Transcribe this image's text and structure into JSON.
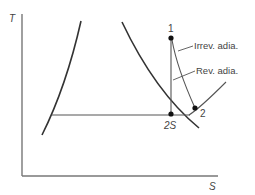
{
  "diagram": {
    "type": "T-S diagram",
    "axes": {
      "y_label": "T",
      "x_label": "S"
    },
    "points": {
      "p1": "1",
      "p2": "2",
      "p2s": "2S"
    },
    "annotations": {
      "irreversible": "Irrev. adia.",
      "reversible": "Rev. adia."
    },
    "colors": {
      "line": "#333333",
      "axis": "#777777",
      "text": "#444444"
    }
  }
}
